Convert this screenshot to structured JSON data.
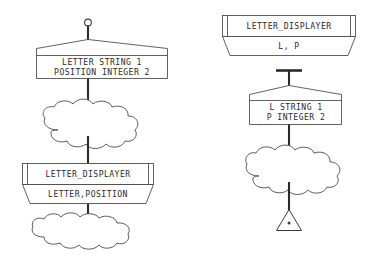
{
  "diagram": {
    "background_color": "#ffffff",
    "line_color": "#3a3a3a",
    "connector_color": "#2b2b2b",
    "text_color": "#2a2a2a"
  },
  "left_column": {
    "terminator_top": {
      "symbol": "ring-terminator"
    },
    "data_box": {
      "symbol": "pennant-data-box",
      "line1": "LETTER STRING 1",
      "line2": "POSITION INTEGER 2"
    },
    "cloud_upper": {
      "symbol": "cloud-process"
    },
    "module": {
      "symbol": "module-symbol",
      "name": "LETTER_DISPLAYER",
      "params": "LETTER,POSITION"
    },
    "cloud_lower": {
      "symbol": "cloud-process"
    }
  },
  "right_column": {
    "module": {
      "symbol": "module-symbol",
      "name": "LETTER_DISPLAYER",
      "params": "L, P"
    },
    "connector_bar": {
      "symbol": "tee-connector"
    },
    "data_box": {
      "symbol": "pennant-data-box",
      "line1": "L STRING 1",
      "line2": "P INTEGER 2"
    },
    "cloud": {
      "symbol": "cloud-process"
    },
    "terminator_bottom": {
      "symbol": "triangle-terminator"
    }
  }
}
